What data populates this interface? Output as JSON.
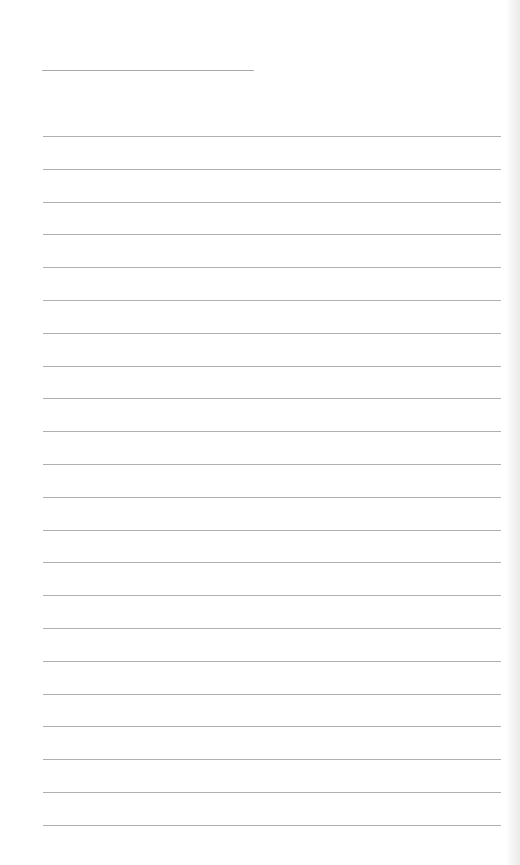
{
  "page": {
    "type": "lined-notebook-page",
    "title_line": {
      "text": ""
    },
    "rule_count": 22,
    "rule_start_y": 136,
    "rule_spacing": 32.8,
    "rule_color": "#b0b0b0"
  }
}
